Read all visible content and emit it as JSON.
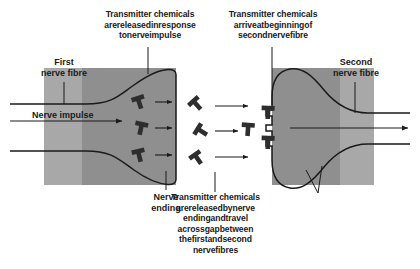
{
  "figure": {
    "type": "biology-diagram"
  },
  "colors": {
    "outer_band": "#a8a8a8",
    "inner_band": "#8f8f8f",
    "membrane_line": "#1a1a1a",
    "molecule": "#2e2e2e",
    "background": "#ffffff",
    "text": "#1a1a1a",
    "text_on_gray": "#ffffff"
  },
  "annotations": {
    "top_left_callout": "Transmitter chemicals\narereleasedinresponse\ntonerveimpulse",
    "top_right_callout": "Transmitter chemicals\narriveatbeginningof\nsecondnervefibre",
    "first_fibre_label": "First\nnerve fibre",
    "second_fibre_label": "Second\nnerve fibre",
    "nerve_impulse_label": "Nerve impulse",
    "nerve_ending_label": "Nerve\nending",
    "bottom_centre_callout": "Transmitter chemicals\narereleasedbynerve\nendingandtravel\nacrossgapbetween\nthefirstandsecond\nnervefibres",
    "bottom_right_callout": "When enough chemicals\nreach the second nerve\nfibre, an impulse is\ntriggered"
  },
  "icons": {
    "molecule": "transmitter-molecule-icon",
    "arrow": "arrow-right-icon",
    "receptor": "receptor-site-icon"
  },
  "molecules": {
    "inside_first_ending": 3,
    "in_gap": 4,
    "docked_at_receptors": 2
  }
}
